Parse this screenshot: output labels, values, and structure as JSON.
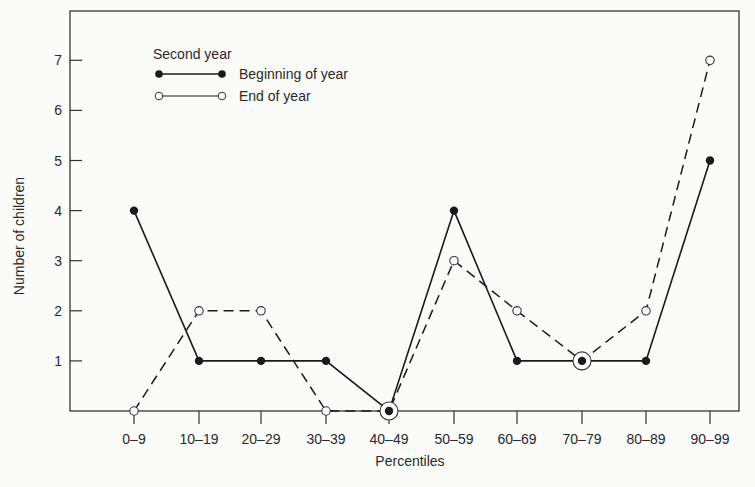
{
  "chart_data": {
    "type": "line",
    "title": "",
    "xlabel": "Percentiles",
    "ylabel": "Number of children",
    "categories": [
      "0-9",
      "10-19",
      "20-29",
      "30-39",
      "40-49",
      "50-59",
      "60-69",
      "70-79",
      "80-89",
      "90-99"
    ],
    "yticks": [
      1,
      2,
      3,
      4,
      5,
      6,
      7
    ],
    "ylim": [
      0,
      8
    ],
    "grid": false,
    "legend": {
      "title": "Second year",
      "position": "upper-left",
      "entries": [
        "Beginning of year",
        "End of year"
      ]
    },
    "series": [
      {
        "name": "Beginning of year",
        "style": "solid",
        "marker": "filled-circle",
        "values": [
          4,
          1,
          1,
          1,
          0,
          4,
          1,
          1,
          1,
          5
        ]
      },
      {
        "name": "End of year",
        "style": "dashed",
        "marker": "open-circle",
        "values": [
          0,
          2,
          2,
          0,
          0,
          3,
          2,
          1,
          2,
          7
        ]
      }
    ],
    "colors": {
      "line": "#1a1a1a",
      "background": "#fbfbf9"
    }
  }
}
